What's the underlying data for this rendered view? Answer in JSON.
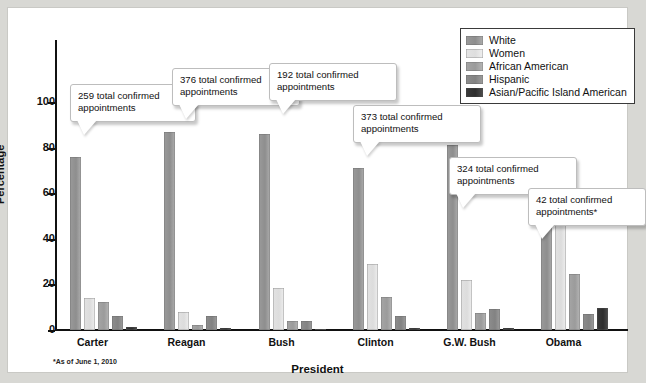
{
  "chart_data": {
    "type": "bar",
    "title": "",
    "xlabel": "President",
    "ylabel": "Percentage",
    "ylim": [
      0,
      100
    ],
    "yticks": [
      0,
      20,
      40,
      60,
      80,
      100
    ],
    "grid": false,
    "legend_position": "top-right",
    "categories": [
      "Carter",
      "Reagan",
      "Bush",
      "Clinton",
      "G.W. Bush",
      "Obama"
    ],
    "series": [
      {
        "name": "White",
        "color": "#949494",
        "values": [
          76,
          87,
          86,
          71,
          81,
          59.5
        ]
      },
      {
        "name": "Women",
        "color": "#e0e0e0",
        "values": [
          14,
          8,
          18.5,
          29,
          22,
          50
        ]
      },
      {
        "name": "African American",
        "color": "#a5a5a5",
        "values": [
          12.5,
          2,
          4,
          14.5,
          7.5,
          24.5
        ]
      },
      {
        "name": "Hispanic",
        "color": "#8a8a8a",
        "values": [
          6,
          6,
          4,
          6,
          9,
          7
        ]
      },
      {
        "name": "Asian/Pacific Island American",
        "color": "#333333",
        "values": [
          1.5,
          0.7,
          0.5,
          1,
          0.7,
          9.5
        ]
      }
    ],
    "annotations": [
      {
        "category": "Carter",
        "text": "259 total confirmed appointments"
      },
      {
        "category": "Reagan",
        "text": "376 total confirmed appointments"
      },
      {
        "category": "Bush",
        "text": "192 total confirmed appointments"
      },
      {
        "category": "Clinton",
        "text": "373 total confirmed appointments"
      },
      {
        "category": "G.W. Bush",
        "text": "324 total confirmed appointments"
      },
      {
        "category": "Obama",
        "text": "42 total confirmed appointments*"
      }
    ],
    "footnote": "*As of June 1, 2010"
  },
  "legend": {
    "items": [
      {
        "label": "White"
      },
      {
        "label": "Women"
      },
      {
        "label": "African American"
      },
      {
        "label": "Hispanic"
      },
      {
        "label": "Asian/Pacific Island American"
      }
    ]
  },
  "axes": {
    "y_title": "Percentage",
    "x_title": "President",
    "y_ticks": [
      {
        "label": "100"
      },
      {
        "label": "80"
      },
      {
        "label": "60"
      },
      {
        "label": "40"
      },
      {
        "label": "20"
      },
      {
        "label": "0"
      }
    ]
  },
  "callouts": [
    {
      "text": "259 total confirmed appointments"
    },
    {
      "text": "376 total confirmed appointments"
    },
    {
      "text": "192 total confirmed appointments"
    },
    {
      "text": "373 total confirmed appointments"
    },
    {
      "text": "324 total confirmed appointments"
    },
    {
      "text": "42 total confirmed appointments*"
    }
  ],
  "footnote": "*As of June 1, 2010"
}
